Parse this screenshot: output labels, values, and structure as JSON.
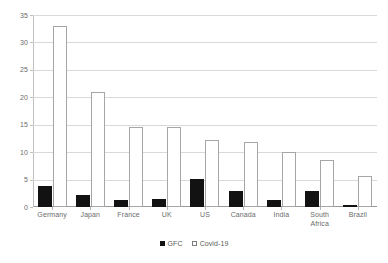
{
  "chart_data": {
    "type": "bar",
    "title": "",
    "subtitle": "",
    "xlabel": "",
    "ylabel": "",
    "categories": [
      "Germany",
      "Japan",
      "France",
      "UK",
      "US",
      "Canada",
      "India",
      "South\nAfrica",
      "Brazil"
    ],
    "series": [
      {
        "name": "GFC",
        "color": "#121212",
        "style": "filled",
        "values": [
          3.8,
          2.2,
          1.3,
          1.5,
          5.1,
          2.9,
          1.2,
          2.9,
          0.4
        ]
      },
      {
        "name": "Covid-19",
        "color": "#ffffff",
        "style": "hollow",
        "values": [
          33.0,
          21.0,
          14.5,
          14.5,
          12.2,
          11.9,
          10.1,
          8.6,
          5.6
        ]
      }
    ],
    "ylim": [
      0,
      35
    ],
    "yticks": [
      0,
      5,
      10,
      15,
      20,
      25,
      30,
      35
    ],
    "ytick_labels": [
      "0",
      "5",
      "10",
      "15",
      "20",
      "25",
      "30",
      "35"
    ],
    "grid": true,
    "grid_axis": "y",
    "legend_position": "bottom",
    "legend_entries": [
      "GFC",
      "Covid-19"
    ]
  }
}
